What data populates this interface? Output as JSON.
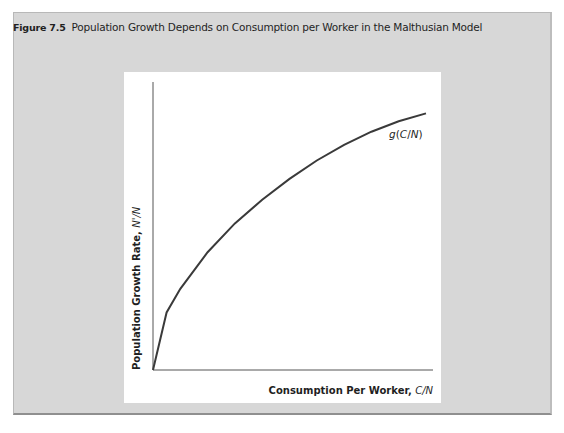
{
  "figure": {
    "number": "Figure 7.5",
    "title": "Population Growth Depends on Consumption per Worker in the Malthusian Model"
  },
  "chart_data": {
    "type": "line",
    "title": "Population Growth Depends on Consumption per Worker in the Malthusian Model",
    "xlabel": "Consumption Per Worker, C/N",
    "ylabel": "Population Growth Rate, N'/N",
    "xlabel_main": "Consumption Per Worker, ",
    "xlabel_var": "C/N",
    "ylabel_main": "Population Growth Rate, ",
    "ylabel_var": "N'/N",
    "grid": false,
    "legend": "none",
    "series": [
      {
        "name": "g(C/N)",
        "label": "g(C/N)",
        "description": "increasing concave function starting at origin",
        "x": [
          0,
          0.05,
          0.1,
          0.2,
          0.3,
          0.4,
          0.5,
          0.6,
          0.7,
          0.8,
          0.9,
          1.0
        ],
        "y": [
          0,
          0.22,
          0.31,
          0.45,
          0.56,
          0.65,
          0.73,
          0.8,
          0.86,
          0.91,
          0.95,
          0.98
        ]
      }
    ],
    "xlim": [
      0,
      1
    ],
    "ylim": [
      0,
      1.1
    ],
    "ticks": "none"
  }
}
